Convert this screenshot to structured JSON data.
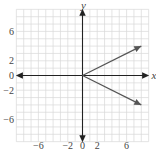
{
  "chart_data": {
    "type": "line",
    "title": "",
    "xlabel": "x",
    "ylabel": "y",
    "xlim": [
      -9,
      9
    ],
    "ylim": [
      -9,
      9
    ],
    "grid": true,
    "x_tick_labels": [
      "−6",
      "−2",
      "0",
      "2",
      "6"
    ],
    "x_tick_values": [
      -6,
      -2,
      0,
      2,
      6
    ],
    "y_tick_labels": [
      "6",
      "2",
      "0",
      "−2",
      "−6"
    ],
    "y_tick_values": [
      6,
      2,
      0,
      -2,
      -6
    ],
    "series": [
      {
        "name": "upper ray",
        "x": [
          0,
          8
        ],
        "y": [
          0,
          4
        ],
        "arrow_end": true
      },
      {
        "name": "lower ray",
        "x": [
          0,
          8
        ],
        "y": [
          0,
          -4
        ],
        "arrow_end": true
      }
    ],
    "legend": null
  },
  "colors": {
    "grid": "#d8d8d8",
    "axis": "#222222",
    "ray": "#555555",
    "text": "#444444"
  }
}
